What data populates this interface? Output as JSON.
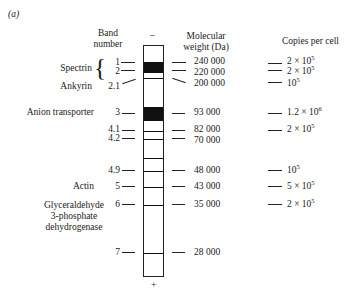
{
  "panel_label": "(a)",
  "headers": {
    "band_number": [
      "Band",
      "number"
    ],
    "polarity_top": "–",
    "molecular_weight": [
      "Molecular",
      "weight (Da)"
    ],
    "copies_per_cell": "Copies per cell",
    "polarity_bottom": "+"
  },
  "proteins": {
    "spectrin": "Spectrin",
    "ankyrin": "Ankyrin",
    "anion_transporter": "Anion transporter",
    "actin": "Actin",
    "gapdh": [
      "Glyceraldehyde",
      "3-phosphate",
      "dehydrogenase"
    ]
  },
  "bands": [
    {
      "band": "1",
      "mw": "240 000",
      "copies_base": "2 × 10",
      "copies_exp": "5"
    },
    {
      "band": "2",
      "mw": "220 000",
      "copies_base": "2 × 10",
      "copies_exp": "5"
    },
    {
      "band": "2.1",
      "mw": "200 000",
      "copies_base": "10",
      "copies_exp": "5"
    },
    {
      "band": "3",
      "mw": "93 000",
      "copies_base": "1.2 × 10",
      "copies_exp": "6"
    },
    {
      "band": "4.1",
      "mw": "82 000",
      "copies_base": "2 × 10",
      "copies_exp": "5"
    },
    {
      "band": "4.2",
      "mw": "70 000",
      "copies_base": "",
      "copies_exp": ""
    },
    {
      "band": "4.9",
      "mw": "48 000",
      "copies_base": "10",
      "copies_exp": "5"
    },
    {
      "band": "5",
      "mw": "43 000",
      "copies_base": "5 × 10",
      "copies_exp": "5"
    },
    {
      "band": "6",
      "mw": "35 000",
      "copies_base": "2 × 10",
      "copies_exp": "5"
    },
    {
      "band": "7",
      "mw": "28 000",
      "copies_base": "",
      "copies_exp": ""
    }
  ]
}
